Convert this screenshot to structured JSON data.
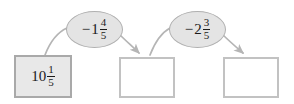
{
  "diagram": {
    "type": "flow-chain",
    "background_color": "#ffffff",
    "box_fill_start": "#e8e8e8",
    "box_fill_empty": "#ffffff",
    "box_border_color": "#b8b8b8",
    "ellipse_fill": "#e4e4e4",
    "ellipse_border_color": "#b0b0b0",
    "arrow_color": "#b5b5b5",
    "text_color": "#1a1a1a",
    "boxes": [
      {
        "id": "box-1",
        "state": "filled",
        "has_value": true,
        "sign": "",
        "whole": "10",
        "numerator": "1",
        "denominator": "5",
        "value_text": "10 1/5"
      },
      {
        "id": "box-2",
        "state": "empty",
        "has_value": false,
        "sign": "",
        "whole": "",
        "numerator": "",
        "denominator": "",
        "value_text": ""
      },
      {
        "id": "box-3",
        "state": "empty",
        "has_value": false,
        "sign": "",
        "whole": "",
        "numerator": "",
        "denominator": "",
        "value_text": ""
      }
    ],
    "operations": [
      {
        "id": "op-1",
        "sign": "−",
        "whole": "1",
        "numerator": "4",
        "denominator": "5",
        "value_text": "−1 4/5"
      },
      {
        "id": "op-2",
        "sign": "−",
        "whole": "2",
        "numerator": "3",
        "denominator": "5",
        "value_text": "−2 3/5"
      }
    ]
  }
}
